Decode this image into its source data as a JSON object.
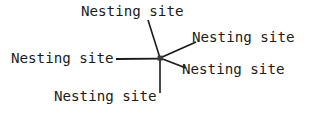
{
  "diagram": {
    "background_color": "#ffffff",
    "line_color": "#1b1b1b",
    "text_color": "#1b1b1b",
    "hub": {
      "x": 160,
      "y": 58,
      "marker": "square",
      "size": 5
    },
    "spokes": [
      {
        "id": "spoke-top",
        "label": "Nesting site",
        "direction": "up-left",
        "x1": 160,
        "y1": 58,
        "x2": 148,
        "y2": 20,
        "label_x": 81,
        "label_y": 4
      },
      {
        "id": "spoke-upper-right",
        "label": "Nesting site",
        "direction": "up-right",
        "x1": 160,
        "y1": 58,
        "x2": 196,
        "y2": 42,
        "label_x": 192,
        "label_y": 30
      },
      {
        "id": "spoke-left",
        "label": "Nesting site",
        "direction": "left",
        "x1": 160,
        "y1": 58,
        "x2": 116,
        "y2": 59,
        "label_x": 11,
        "label_y": 51
      },
      {
        "id": "spoke-lower-right",
        "label": "Nesting site",
        "direction": "down-right",
        "x1": 160,
        "y1": 58,
        "x2": 186,
        "y2": 68,
        "label_x": 182,
        "label_y": 62
      },
      {
        "id": "spoke-bottom",
        "label": "Nesting site",
        "direction": "down",
        "x1": 160,
        "y1": 58,
        "x2": 160,
        "y2": 93,
        "label_x": 54,
        "label_y": 89
      }
    ]
  }
}
